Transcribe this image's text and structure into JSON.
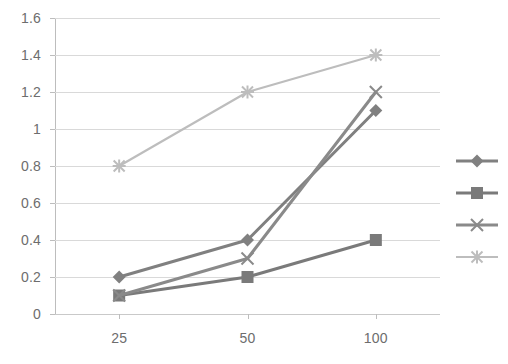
{
  "chart_data": {
    "type": "line",
    "title": "",
    "subtitle": "",
    "xlabel": "",
    "ylabel": "",
    "categories": [
      "25",
      "50",
      "100"
    ],
    "x": [
      25,
      50,
      100
    ],
    "ylim": [
      0,
      1.6
    ],
    "ytick_labels": [
      "0",
      "0.2",
      "0.4",
      "0.6",
      "0.8",
      "1",
      "1.2",
      "1.4",
      "1.6"
    ],
    "ytick_values": [
      0,
      0.2,
      0.4,
      0.6,
      0.8,
      1.0,
      1.2,
      1.4,
      1.6
    ],
    "grid": "horizontal",
    "legend_position": "right",
    "legend_labels_visible": false,
    "series": [
      {
        "name": "series-1",
        "label": "",
        "marker": "diamond",
        "color": "#808080",
        "values": [
          0.2,
          0.4,
          1.1
        ]
      },
      {
        "name": "series-2",
        "label": "",
        "marker": "square",
        "color": "#7a7a7a",
        "values": [
          0.1,
          0.2,
          0.4
        ]
      },
      {
        "name": "series-3",
        "label": "",
        "marker": "cross",
        "color": "#8a8a8a",
        "values": [
          0.1,
          0.3,
          1.2
        ]
      },
      {
        "name": "series-4",
        "label": "",
        "marker": "asterisk",
        "color": "#bdbdbd",
        "values": [
          0.8,
          1.2,
          1.4
        ]
      }
    ]
  },
  "colors": {
    "background": "#ffffff",
    "gridline": "#d9d9d9",
    "axis": "#bdbdbd",
    "tick_text": "#6d6d6d",
    "series_1": "#808080",
    "series_2": "#7a7a7a",
    "series_3": "#8a8a8a",
    "series_4": "#bdbdbd"
  }
}
